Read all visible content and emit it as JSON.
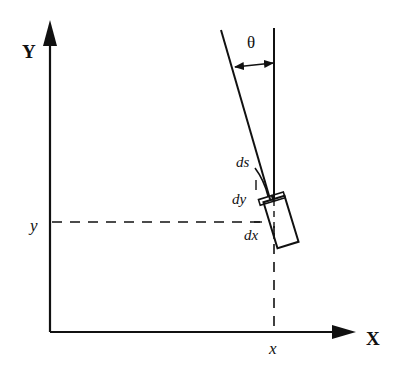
{
  "diagram": {
    "title": "",
    "labels": {
      "y_axis": "Y",
      "x_axis": "X",
      "angle": "θ",
      "y_coord": "y",
      "x_coord": "x",
      "ds": "ds",
      "dy": "dy",
      "dx": "dx"
    },
    "elements": [
      "x-axis with arrow",
      "y-axis with arrow",
      "vertical reference line",
      "heading line (tilted by theta)",
      "theta angle double-arrow",
      "vehicle rectangle (rotated)",
      "dashed projection lines to x and y",
      "ds arc segment"
    ],
    "colors": {
      "stroke": "#111111",
      "background": "#ffffff"
    }
  }
}
